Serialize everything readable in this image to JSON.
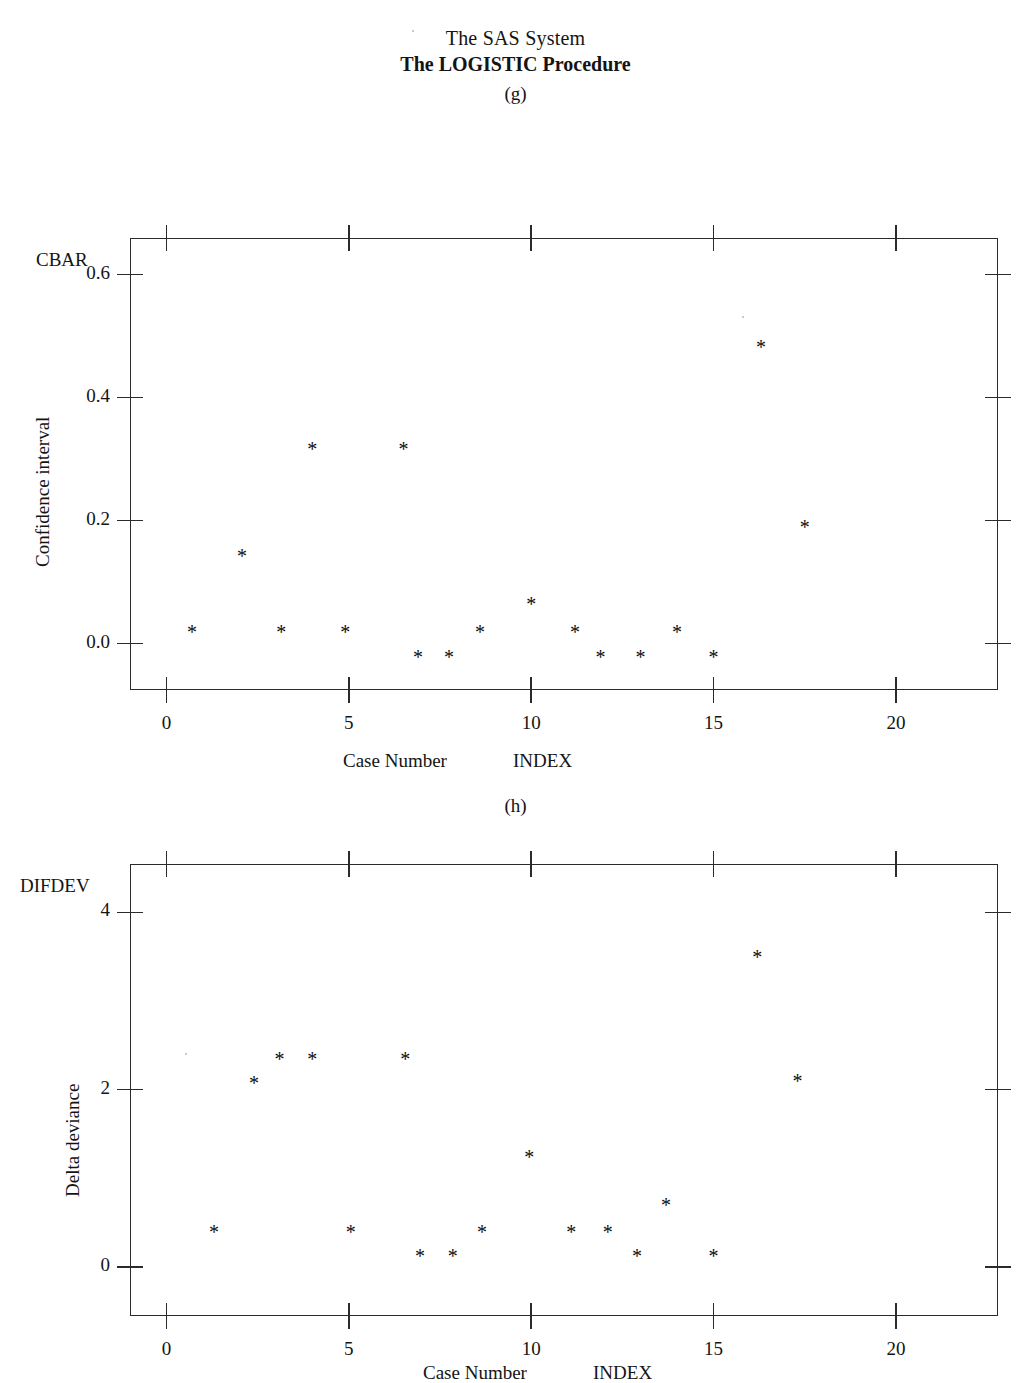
{
  "header": {
    "system_title": "The SAS System",
    "procedure_title": "The LOGISTIC Procedure"
  },
  "panels": [
    {
      "tag": "(g)",
      "corner_label": "CBAR",
      "ylabel": "Confidence interval",
      "xaxis_titles": [
        "Case Number",
        "INDEX"
      ],
      "marker_glyph": "*"
    },
    {
      "tag": "(h)",
      "corner_label": "DIFDEV",
      "ylabel": "Delta deviance",
      "xaxis_titles": [
        "Case Number",
        "INDEX"
      ],
      "marker_glyph": "*"
    }
  ],
  "chart_data": [
    {
      "type": "scatter",
      "title": "(g)",
      "series_name": "CBAR",
      "xlabel": "Case Number",
      "ylabel": "Confidence interval",
      "xvar": "INDEX",
      "yvar": "CBAR",
      "xlim": [
        -1.0,
        22.8
      ],
      "ylim": [
        -0.075,
        0.66
      ],
      "xticks": [
        0,
        5,
        10,
        15,
        20
      ],
      "xtick_labels": [
        "0",
        "5",
        "10",
        "15",
        "20"
      ],
      "yticks": [
        0.0,
        0.2,
        0.4,
        0.6
      ],
      "ytick_labels": [
        "0.0",
        "0.2",
        "0.4",
        "0.6"
      ],
      "grid": false,
      "legend": "none",
      "marker": "*",
      "x": [
        0.7,
        2.07,
        3.15,
        4.0,
        4.9,
        6.5,
        6.9,
        7.75,
        8.6,
        10.0,
        11.2,
        11.9,
        13.0,
        14.0,
        15.0,
        16.3,
        17.5
      ],
      "y": [
        0.027,
        0.15,
        0.027,
        0.325,
        0.027,
        0.325,
        -0.014,
        -0.014,
        0.027,
        0.072,
        0.027,
        -0.014,
        -0.014,
        0.027,
        -0.014,
        0.49,
        0.197
      ]
    },
    {
      "type": "scatter",
      "title": "(h)",
      "series_name": "DIFDEV",
      "xlabel": "Case Number",
      "ylabel": "Delta deviance",
      "xvar": "INDEX",
      "yvar": "DIFDEV",
      "xlim": [
        -1.0,
        22.8
      ],
      "ylim": [
        -0.55,
        4.55
      ],
      "xticks": [
        0,
        5,
        10,
        15,
        20
      ],
      "xtick_labels": [
        "0",
        "5",
        "10",
        "15",
        "20"
      ],
      "yticks": [
        0,
        2,
        4
      ],
      "ytick_labels": [
        "0",
        "2",
        "4"
      ],
      "grid": false,
      "legend": "none",
      "marker": "*",
      "x": [
        1.3,
        2.4,
        3.1,
        4.0,
        5.05,
        6.55,
        6.95,
        7.85,
        8.65,
        9.95,
        11.1,
        12.1,
        12.9,
        13.7,
        15.0,
        16.2,
        17.3
      ],
      "y": [
        0.45,
        2.13,
        2.4,
        2.4,
        0.45,
        2.4,
        0.18,
        0.18,
        0.45,
        1.3,
        0.45,
        0.45,
        0.18,
        0.75,
        0.18,
        3.55,
        2.15
      ]
    }
  ]
}
